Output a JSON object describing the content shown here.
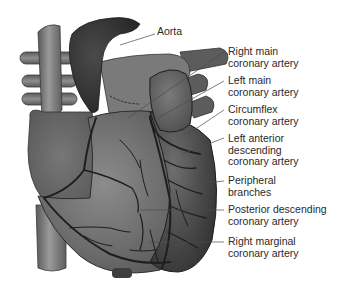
{
  "figure": {
    "colors": {
      "background": "#ffffff",
      "heart_body": "#6a6a6a",
      "heart_dark": "#3c3c3c",
      "aorta": "#353535",
      "vessel_light": "#8a8a8a",
      "artery_line": "#1e1e1e",
      "leader_line": "#4a4a4a",
      "label_text": "#2a2a2a"
    },
    "labels": [
      {
        "id": "aorta",
        "text": "Aorta"
      },
      {
        "id": "right-main-coronary-artery",
        "text": "Right main\ncoronary artery"
      },
      {
        "id": "left-main-coronary-artery",
        "text": "Left main\ncoronary artery"
      },
      {
        "id": "circumflex-coronary-artery",
        "text": "Circumflex\ncoronary artery"
      },
      {
        "id": "left-anterior-descending-coronary-artery",
        "text": "Left anterior\ndescending\ncoronary artery"
      },
      {
        "id": "peripheral-branches",
        "text": "Peripheral\nbranches"
      },
      {
        "id": "posterior-descending-coronary-artery",
        "text": "Posterior descending\ncoronary artery"
      },
      {
        "id": "right-marginal-coronary-artery",
        "text": "Right marginal\ncoronary artery"
      }
    ]
  }
}
